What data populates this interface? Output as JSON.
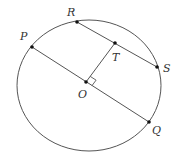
{
  "diagram": {
    "type": "circle-geometry",
    "circle": {
      "cx": 89,
      "cy": 85.5,
      "rx": 72,
      "ry": 65.5,
      "stroke": "#555555"
    },
    "points": [
      {
        "id": "P",
        "label": "P",
        "x": 32,
        "y": 47,
        "lx": 20,
        "ly": 40
      },
      {
        "id": "R",
        "label": "R",
        "x": 77,
        "y": 22,
        "lx": 67,
        "ly": 16
      },
      {
        "id": "T",
        "label": "T",
        "x": 115,
        "y": 43,
        "lx": 112,
        "ly": 61
      },
      {
        "id": "S",
        "label": "S",
        "x": 157,
        "y": 67,
        "lx": 163,
        "ly": 72
      },
      {
        "id": "O",
        "label": "O",
        "x": 86,
        "y": 82,
        "lx": 78,
        "ly": 98
      },
      {
        "id": "Q",
        "label": "Q",
        "x": 149,
        "y": 122,
        "lx": 152,
        "ly": 134
      }
    ],
    "segments": [
      {
        "name": "segment-PQ",
        "from": "P",
        "to": "Q"
      },
      {
        "name": "segment-RS",
        "from": "R",
        "to": "S"
      },
      {
        "name": "segment-OT",
        "from": "O",
        "to": "T"
      }
    ],
    "right_angle_at": "O",
    "line_color": "#555555",
    "point_color": "#111111"
  }
}
